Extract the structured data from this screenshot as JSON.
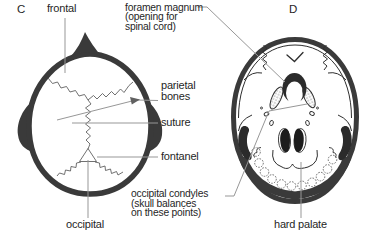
{
  "figure": {
    "panel_c": {
      "letter": "C",
      "labels": {
        "frontal": "frontal",
        "parietal_bones": "parietal\nbones",
        "suture": "suture",
        "fontanel": "fontanel",
        "occipital": "occipital"
      }
    },
    "panel_d": {
      "letter": "D",
      "labels": {
        "foramen_magnum": "foramen magnum\n(opening for\nspinal cord)",
        "occipital_condyles": "occipital condyles\n(skull balances\non these points)",
        "hard_palate": "hard palate"
      }
    },
    "colors": {
      "background": "#ffffff",
      "bone_outline": "#3a3a3a",
      "detail_line": "#2e2e2e",
      "suture_line": "#606060",
      "leader_line": "#979797",
      "text": "#1f1f1f"
    }
  }
}
